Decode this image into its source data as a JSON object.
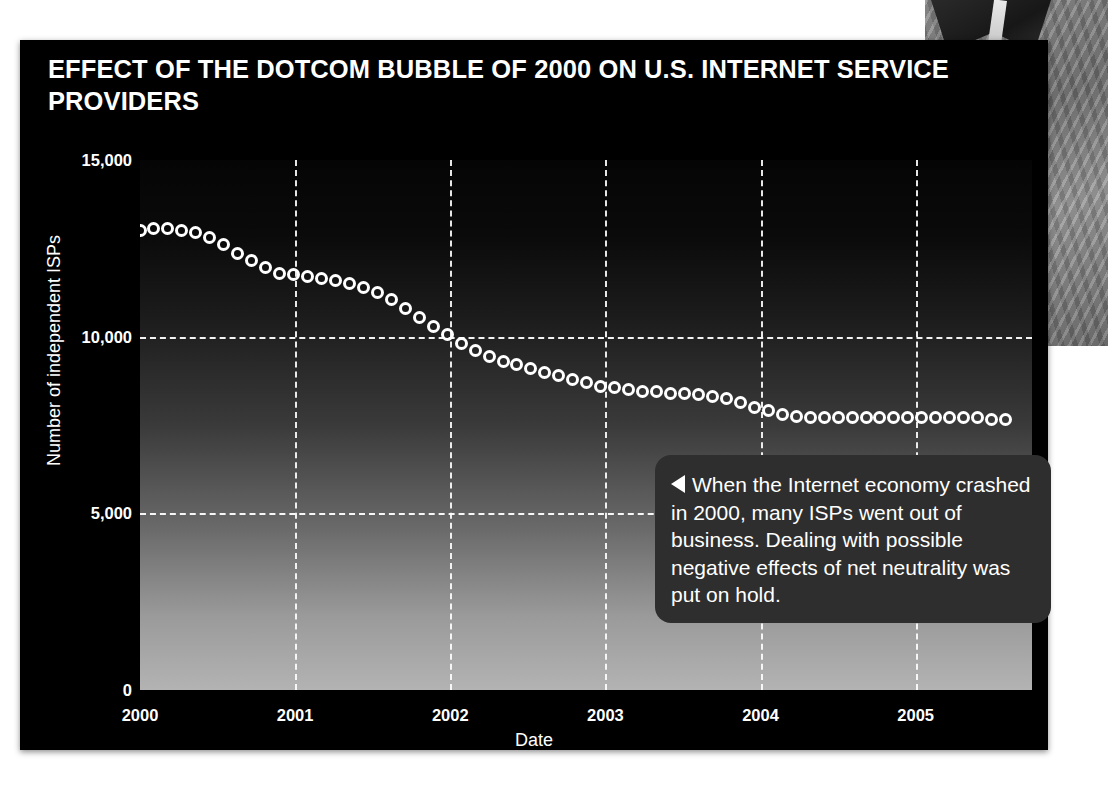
{
  "chart_data": {
    "type": "scatter",
    "title": "EFFECT OF THE DOTCOM BUBBLE OF 2000 ON U.S. INTERNET SERVICE PROVIDERS",
    "xlabel": "Date",
    "ylabel": "Number of independent ISPs",
    "xlim": [
      2000,
      2005.75
    ],
    "ylim": [
      0,
      15000
    ],
    "ytick_labels": [
      "15,000",
      "10,000",
      "5,000",
      "0"
    ],
    "ytick_values": [
      15000,
      10000,
      5000,
      0
    ],
    "xtick_labels": [
      "2000",
      "2001",
      "2002",
      "2003",
      "2004",
      "2005"
    ],
    "xtick_values": [
      2000,
      2001,
      2002,
      2003,
      2004,
      2005
    ],
    "grid": "dashed-white",
    "legend": "none",
    "marker": "open-circle-white",
    "series": [
      {
        "name": "Number of independent ISPs",
        "x": [
          2000.0,
          2000.09,
          2000.18,
          2000.27,
          2000.36,
          2000.45,
          2000.54,
          2000.63,
          2000.72,
          2000.81,
          2000.9,
          2000.99,
          2001.08,
          2001.17,
          2001.26,
          2001.35,
          2001.44,
          2001.53,
          2001.62,
          2001.71,
          2001.8,
          2001.89,
          2001.98,
          2002.07,
          2002.16,
          2002.25,
          2002.34,
          2002.43,
          2002.52,
          2002.61,
          2002.7,
          2002.79,
          2002.88,
          2002.97,
          2003.06,
          2003.15,
          2003.24,
          2003.33,
          2003.42,
          2003.51,
          2003.6,
          2003.69,
          2003.78,
          2003.87,
          2003.96,
          2004.05,
          2004.14,
          2004.23,
          2004.32,
          2004.41,
          2004.5,
          2004.59,
          2004.68,
          2004.77,
          2004.86,
          2004.95,
          2005.04,
          2005.13,
          2005.22,
          2005.31,
          2005.4,
          2005.49,
          2005.58
        ],
        "values": [
          13000,
          13050,
          13050,
          13000,
          12950,
          12800,
          12600,
          12350,
          12150,
          11950,
          11800,
          11750,
          11700,
          11650,
          11600,
          11500,
          11400,
          11250,
          11050,
          10800,
          10550,
          10300,
          10050,
          9800,
          9600,
          9450,
          9300,
          9200,
          9100,
          9000,
          8900,
          8800,
          8700,
          8600,
          8550,
          8500,
          8450,
          8450,
          8400,
          8400,
          8350,
          8300,
          8250,
          8150,
          8000,
          7900,
          7800,
          7750,
          7700,
          7700,
          7700,
          7700,
          7700,
          7700,
          7700,
          7700,
          7700,
          7700,
          7700,
          7700,
          7700,
          7650,
          7650
        ]
      }
    ]
  },
  "caption": {
    "arrow": "left-triangle",
    "text": "When the Internet economy crashed in 2000, many ISPs went out of business. Dealing with possible negative effects of net neutrality was put on hold."
  }
}
